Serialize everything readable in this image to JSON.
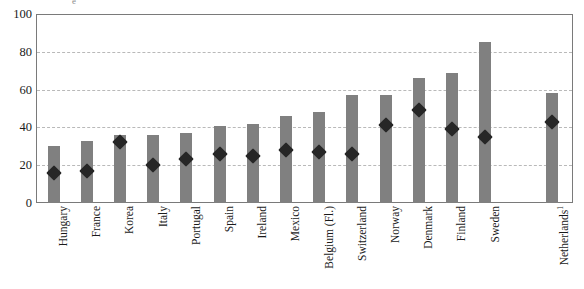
{
  "chart_data": {
    "type": "bar",
    "title": "",
    "subtitle": "",
    "xlabel": "",
    "ylabel": "",
    "ylim": [
      0,
      100
    ],
    "yticks": [
      0,
      20,
      40,
      60,
      80,
      100
    ],
    "grid": true,
    "legend_position": "none",
    "categories": [
      "Hungary",
      "France",
      "Korea",
      "Italy",
      "Portugal",
      "Spain",
      "Ireland",
      "Mexico",
      "Belgium (Fl.)",
      "Switzerland",
      "Norway",
      "Denmark",
      "Finland",
      "Sweden",
      "Netherlands"
    ],
    "category_footnotes": [
      "",
      "",
      "",
      "",
      "",
      "",
      "",
      "",
      "",
      "",
      "",
      "",
      "",
      "",
      "1"
    ],
    "series": [
      {
        "name": "bar",
        "type": "bar",
        "color": "#808080",
        "values": [
          30,
          33,
          36,
          36,
          37,
          41,
          42,
          46,
          48,
          57,
          57,
          66,
          69,
          85,
          58
        ]
      },
      {
        "name": "marker",
        "type": "scatter",
        "marker": "diamond",
        "color": "#262626",
        "values": [
          19,
          20,
          35,
          23,
          26,
          29,
          28,
          31,
          30,
          29,
          44,
          52,
          42,
          38,
          46
        ]
      }
    ]
  },
  "axis": {
    "y_tick_labels": [
      "0",
      "20",
      "40",
      "60",
      "80",
      "100"
    ]
  },
  "artifacts": {
    "top_remnant": "e"
  }
}
